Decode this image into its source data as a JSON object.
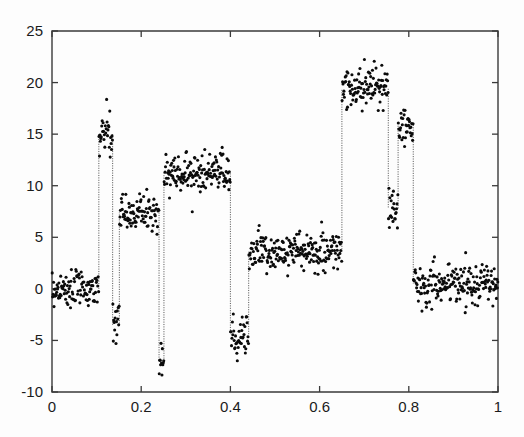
{
  "figure": {
    "title": "",
    "background_color": "#fdfdfd",
    "point_color": "#0b0b0b",
    "axis_color": "#3a3a3a"
  },
  "chart_data": {
    "type": "scatter",
    "title": "",
    "xlabel": "",
    "ylabel": "",
    "xlim": [
      0,
      1
    ],
    "ylim": [
      -10,
      25
    ],
    "grid": false,
    "legend": null,
    "x_ticks": [
      0,
      0.2,
      0.4,
      0.6,
      0.8,
      1
    ],
    "x_tick_labels": [
      "0",
      "0.2",
      "0.4",
      "0.6",
      "0.8",
      "1"
    ],
    "y_ticks": [
      -10,
      -5,
      0,
      5,
      10,
      15,
      20,
      25
    ],
    "y_tick_labels": [
      "-10",
      "-5",
      "0",
      "5",
      "10",
      "15",
      "20",
      "25"
    ],
    "noise_sigma": 0.95,
    "n_points": 1000,
    "series": [
      {
        "name": "noisy piecewise-constant signal",
        "marker": "dot",
        "color": "#0b0b0b",
        "segments": [
          {
            "x_start": 0.0,
            "x_end": 0.105,
            "level": 0.0
          },
          {
            "x_start": 0.105,
            "x_end": 0.136,
            "level": 15.0
          },
          {
            "x_start": 0.136,
            "x_end": 0.151,
            "level": -3.6
          },
          {
            "x_start": 0.151,
            "x_end": 0.24,
            "level": 7.4
          },
          {
            "x_start": 0.24,
            "x_end": 0.251,
            "level": -7.0
          },
          {
            "x_start": 0.251,
            "x_end": 0.4,
            "level": 11.2
          },
          {
            "x_start": 0.4,
            "x_end": 0.441,
            "level": -4.4
          },
          {
            "x_start": 0.441,
            "x_end": 0.65,
            "level": 3.6
          },
          {
            "x_start": 0.65,
            "x_end": 0.754,
            "level": 19.4
          },
          {
            "x_start": 0.754,
            "x_end": 0.776,
            "level": 7.8
          },
          {
            "x_start": 0.776,
            "x_end": 0.81,
            "level": 15.9
          },
          {
            "x_start": 0.81,
            "x_end": 1.0,
            "level": 0.5
          }
        ]
      }
    ]
  }
}
